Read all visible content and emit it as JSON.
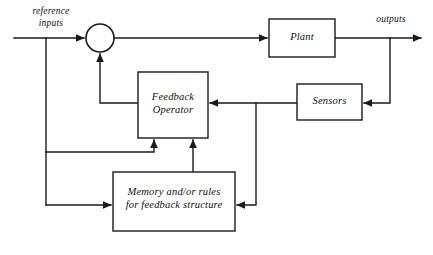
{
  "diagram": {
    "stroke_color": "#1a1a1a",
    "background_color": "#ffffff",
    "blocks": [
      {
        "id": "plant",
        "label": "Plant"
      },
      {
        "id": "sensors",
        "label": "Sensors"
      },
      {
        "id": "feedback_operator",
        "label": "Feedback\nOperator"
      },
      {
        "id": "memory",
        "label": "Memory and/or rules\nfor feedback structure"
      }
    ],
    "junctions": [
      {
        "id": "summing_junction",
        "label": ""
      }
    ],
    "io_labels": [
      {
        "id": "reference_inputs",
        "label": "reference\ninputs"
      },
      {
        "id": "outputs",
        "label": "outputs"
      }
    ]
  }
}
